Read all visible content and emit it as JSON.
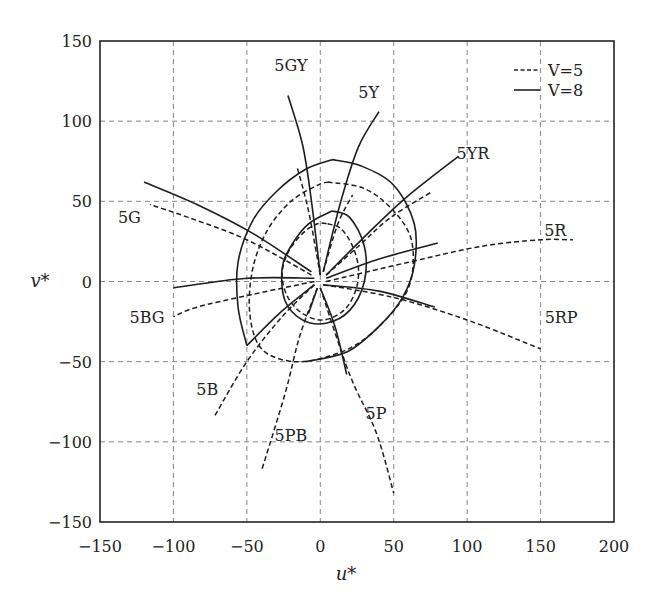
{
  "chart_data": {
    "type": "line",
    "title": "",
    "xlabel": "u*",
    "ylabel": "v*",
    "xlim": [
      -150,
      200
    ],
    "ylim": [
      -150,
      150
    ],
    "xticks": [
      -150,
      -100,
      -50,
      0,
      50,
      100,
      150,
      200
    ],
    "yticks": [
      -150,
      -100,
      -50,
      0,
      50,
      100,
      150
    ],
    "grid": true,
    "legend": {
      "position": "upper right",
      "entries": [
        {
          "label": "V=5",
          "style": "dashed"
        },
        {
          "label": "V=8",
          "style": "solid"
        }
      ]
    },
    "hue_labels": [
      {
        "text": "5GY",
        "u": -20,
        "v": 135
      },
      {
        "text": "5Y",
        "u": 33,
        "v": 118
      },
      {
        "text": "5YR",
        "u": 104,
        "v": 80
      },
      {
        "text": "5R",
        "u": 160,
        "v": 32
      },
      {
        "text": "5RP",
        "u": 164,
        "v": -22
      },
      {
        "text": "5P",
        "u": 38,
        "v": -82
      },
      {
        "text": "5PB",
        "u": -20,
        "v": -96
      },
      {
        "text": "5B",
        "u": -77,
        "v": -67
      },
      {
        "text": "5BG",
        "u": -118,
        "v": -22
      },
      {
        "text": "5G",
        "u": -130,
        "v": 40
      }
    ],
    "series": [
      {
        "name": "V=5 chroma contour inner",
        "group": "V=5",
        "style": "dashed",
        "points": [
          [
            5,
            36
          ],
          [
            14,
            33
          ],
          [
            22,
            22
          ],
          [
            26,
            8
          ],
          [
            24,
            -6
          ],
          [
            16,
            -18
          ],
          [
            2,
            -24
          ],
          [
            -12,
            -20
          ],
          [
            -22,
            -10
          ],
          [
            -26,
            4
          ],
          [
            -22,
            18
          ],
          [
            -12,
            30
          ],
          [
            -2,
            36
          ],
          [
            5,
            36
          ]
        ]
      },
      {
        "name": "V=8 chroma contour inner",
        "group": "V=8",
        "style": "solid",
        "points": [
          [
            8,
            44
          ],
          [
            20,
            40
          ],
          [
            30,
            22
          ],
          [
            30,
            0
          ],
          [
            20,
            -18
          ],
          [
            4,
            -26
          ],
          [
            -12,
            -24
          ],
          [
            -24,
            -12
          ],
          [
            -26,
            8
          ],
          [
            -20,
            22
          ],
          [
            -8,
            36
          ],
          [
            8,
            44
          ]
        ]
      },
      {
        "name": "V=5 chroma contour outer",
        "group": "V=5",
        "style": "dashed",
        "points": [
          [
            5,
            62
          ],
          [
            30,
            58
          ],
          [
            50,
            44
          ],
          [
            62,
            26
          ],
          [
            62,
            2
          ],
          [
            52,
            -16
          ],
          [
            30,
            -36
          ],
          [
            8,
            -46
          ],
          [
            -18,
            -50
          ],
          [
            -40,
            -42
          ],
          [
            -48,
            -20
          ],
          [
            -46,
            8
          ],
          [
            -36,
            32
          ],
          [
            -20,
            50
          ],
          [
            -2,
            60
          ],
          [
            5,
            62
          ]
        ]
      },
      {
        "name": "V=8 chroma contour outer",
        "group": "V=8",
        "style": "solid",
        "points": [
          [
            8,
            76
          ],
          [
            28,
            72
          ],
          [
            50,
            60
          ],
          [
            64,
            36
          ],
          [
            64,
            10
          ],
          [
            56,
            -10
          ],
          [
            40,
            -28
          ],
          [
            18,
            -44
          ],
          [
            -10,
            -50
          ]
        ]
      },
      {
        "name": "V=8 chroma contour outer left",
        "group": "V=8",
        "style": "solid",
        "points": [
          [
            -50,
            -40
          ],
          [
            -56,
            -16
          ],
          [
            -56,
            12
          ],
          [
            -46,
            38
          ],
          [
            -30,
            56
          ],
          [
            -10,
            70
          ],
          [
            8,
            76
          ]
        ]
      },
      {
        "name": "5GY V=8",
        "group": "V=8",
        "style": "solid",
        "points": [
          [
            0,
            4
          ],
          [
            -6,
            50
          ],
          [
            -12,
            85
          ],
          [
            -22,
            116
          ]
        ]
      },
      {
        "name": "5GY V=5",
        "group": "V=5",
        "style": "dashed",
        "points": [
          [
            0,
            4
          ],
          [
            -8,
            44
          ],
          [
            -16,
            72
          ]
        ]
      },
      {
        "name": "5Y V=8",
        "group": "V=8",
        "style": "solid",
        "points": [
          [
            2,
            6
          ],
          [
            14,
            50
          ],
          [
            26,
            84
          ],
          [
            40,
            106
          ]
        ]
      },
      {
        "name": "5Y V=5",
        "group": "V=5",
        "style": "dashed",
        "points": [
          [
            2,
            6
          ],
          [
            12,
            36
          ],
          [
            22,
            54
          ]
        ]
      },
      {
        "name": "5YR V=8",
        "group": "V=8",
        "style": "solid",
        "points": [
          [
            4,
            4
          ],
          [
            28,
            26
          ],
          [
            58,
            52
          ],
          [
            94,
            78
          ]
        ]
      },
      {
        "name": "5YR V=5",
        "group": "V=5",
        "style": "dashed",
        "points": [
          [
            4,
            4
          ],
          [
            26,
            22
          ],
          [
            48,
            40
          ],
          [
            76,
            56
          ]
        ]
      },
      {
        "name": "5R V=8",
        "group": "V=8",
        "style": "solid",
        "points": [
          [
            4,
            2
          ],
          [
            40,
            14
          ],
          [
            80,
            24
          ]
        ]
      },
      {
        "name": "5R V=5",
        "group": "V=5",
        "style": "dashed",
        "points": [
          [
            4,
            0
          ],
          [
            60,
            12
          ],
          [
            110,
            22
          ],
          [
            150,
            26
          ],
          [
            172,
            26
          ]
        ]
      },
      {
        "name": "5RP V=8",
        "group": "V=8",
        "style": "solid",
        "points": [
          [
            2,
            -2
          ],
          [
            40,
            -6
          ],
          [
            78,
            -16
          ]
        ]
      },
      {
        "name": "5RP V=5",
        "group": "V=5",
        "style": "dashed",
        "points": [
          [
            2,
            -2
          ],
          [
            50,
            -10
          ],
          [
            100,
            -24
          ],
          [
            150,
            -42
          ]
        ]
      },
      {
        "name": "5P V=8",
        "group": "V=8",
        "style": "solid",
        "points": [
          [
            0,
            -4
          ],
          [
            10,
            -28
          ],
          [
            18,
            -58
          ]
        ]
      },
      {
        "name": "5P V=5",
        "group": "V=5",
        "style": "dashed",
        "points": [
          [
            0,
            -4
          ],
          [
            20,
            -58
          ],
          [
            38,
            -94
          ],
          [
            50,
            -132
          ]
        ]
      },
      {
        "name": "5PB V=8",
        "group": "V=8",
        "style": "solid",
        "points": [
          [
            -2,
            -4
          ],
          [
            -8,
            -20
          ]
        ]
      },
      {
        "name": "5PB V=5",
        "group": "V=5",
        "style": "dashed",
        "points": [
          [
            -2,
            -4
          ],
          [
            -14,
            -34
          ],
          [
            -24,
            -70
          ],
          [
            -40,
            -118
          ]
        ]
      },
      {
        "name": "5B V=8",
        "group": "V=8",
        "style": "solid",
        "points": [
          [
            -4,
            -2
          ],
          [
            -28,
            -20
          ],
          [
            -50,
            -40
          ]
        ]
      },
      {
        "name": "5B V=5",
        "group": "V=5",
        "style": "dashed",
        "points": [
          [
            -4,
            -2
          ],
          [
            -26,
            -22
          ],
          [
            -50,
            -50
          ],
          [
            -72,
            -84
          ]
        ]
      },
      {
        "name": "5BG V=8",
        "group": "V=8",
        "style": "solid",
        "points": [
          [
            -4,
            2
          ],
          [
            -50,
            2
          ],
          [
            -100,
            -4
          ]
        ]
      },
      {
        "name": "5BG V=5",
        "group": "V=5",
        "style": "dashed",
        "points": [
          [
            -4,
            0
          ],
          [
            -46,
            -8
          ],
          [
            -84,
            -16
          ],
          [
            -100,
            -22
          ]
        ]
      },
      {
        "name": "5G V=8",
        "group": "V=8",
        "style": "solid",
        "points": [
          [
            -6,
            6
          ],
          [
            -46,
            30
          ],
          [
            -84,
            48
          ],
          [
            -120,
            62
          ]
        ]
      },
      {
        "name": "5G V=5",
        "group": "V=5",
        "style": "dashed",
        "points": [
          [
            -6,
            4
          ],
          [
            -50,
            26
          ],
          [
            -90,
            40
          ],
          [
            -116,
            48
          ]
        ]
      }
    ]
  }
}
